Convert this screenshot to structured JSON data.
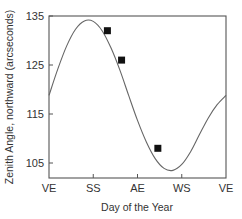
{
  "chart_data": {
    "type": "line",
    "title": "",
    "xlabel": "Day of the Year",
    "ylabel": "Zenith Angle, northward (arcseconds)",
    "x_ticks": [
      "VE",
      "SS",
      "AE",
      "WS",
      "VE"
    ],
    "y_ticks": [
      105,
      115,
      125,
      135
    ],
    "ylim": [
      102,
      135
    ],
    "xlim": [
      0,
      1
    ],
    "grid": false,
    "legend": null,
    "series": [
      {
        "name": "model curve",
        "kind": "line",
        "x": [
          0.0,
          0.05,
          0.1,
          0.15,
          0.2,
          0.25,
          0.3,
          0.35,
          0.4,
          0.45,
          0.5,
          0.55,
          0.6,
          0.65,
          0.7,
          0.75,
          0.8,
          0.85,
          0.9,
          0.95,
          1.0
        ],
        "values": [
          118.8,
          124.2,
          128.9,
          132.3,
          134.0,
          133.9,
          132.0,
          128.5,
          124.0,
          118.8,
          113.7,
          109.3,
          105.9,
          103.9,
          103.5,
          104.7,
          107.3,
          110.8,
          114.2,
          116.9,
          118.8
        ]
      },
      {
        "name": "observations",
        "kind": "scatter",
        "marker": "square",
        "x": [
          0.33,
          0.41,
          0.615
        ],
        "values": [
          132,
          126,
          108
        ]
      }
    ]
  },
  "colors": {
    "axis": "#555555",
    "curve": "#666666",
    "marker": "#111111"
  }
}
